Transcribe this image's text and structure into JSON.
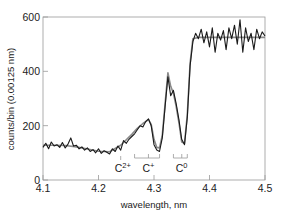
{
  "chart_data": {
    "type": "line",
    "title": "",
    "xlabel": "wavelength, nm",
    "ylabel": "counts/bin (0.00125 nm)",
    "xlim": [
      4.1,
      4.5
    ],
    "ylim": [
      0,
      600
    ],
    "xticks": [
      "4.1",
      "4.2",
      "4.3",
      "4.4",
      "4.5"
    ],
    "yticks": [
      "0",
      "200",
      "400",
      "600"
    ],
    "grid": false,
    "series": [
      {
        "name": "measured (noisy)",
        "color": "#1a1a1a",
        "x": [
          4.1,
          4.105,
          4.11,
          4.115,
          4.12,
          4.125,
          4.13,
          4.135,
          4.14,
          4.145,
          4.15,
          4.155,
          4.16,
          4.165,
          4.17,
          4.175,
          4.18,
          4.185,
          4.19,
          4.195,
          4.2,
          4.205,
          4.21,
          4.215,
          4.22,
          4.225,
          4.23,
          4.235,
          4.24,
          4.245,
          4.25,
          4.255,
          4.26,
          4.265,
          4.27,
          4.275,
          4.28,
          4.285,
          4.29,
          4.295,
          4.3,
          4.305,
          4.31,
          4.315,
          4.32,
          4.325,
          4.33,
          4.335,
          4.34,
          4.345,
          4.35,
          4.355,
          4.36,
          4.365,
          4.37,
          4.375,
          4.38,
          4.385,
          4.39,
          4.395,
          4.4,
          4.405,
          4.41,
          4.415,
          4.42,
          4.425,
          4.43,
          4.435,
          4.44,
          4.445,
          4.45,
          4.455,
          4.46,
          4.465,
          4.47,
          4.475,
          4.48,
          4.485,
          4.49,
          4.495,
          4.5
        ],
        "values": [
          120,
          135,
          115,
          140,
          125,
          130,
          120,
          138,
          118,
          132,
          155,
          125,
          128,
          115,
          122,
          110,
          118,
          105,
          112,
          100,
          115,
          98,
          108,
          102,
          96,
          115,
          105,
          125,
          110,
          145,
          135,
          150,
          160,
          170,
          185,
          200,
          195,
          215,
          225,
          200,
          130,
          110,
          105,
          155,
          270,
          380,
          310,
          330,
          280,
          220,
          150,
          130,
          230,
          420,
          510,
          540,
          520,
          555,
          505,
          545,
          490,
          560,
          470,
          540,
          515,
          550,
          480,
          560,
          520,
          570,
          500,
          590,
          470,
          560,
          510,
          540,
          480,
          555,
          520,
          545,
          530
        ]
      },
      {
        "name": "model fit (smooth)",
        "color": "#8a8a8a",
        "x": [
          4.1,
          4.12,
          4.14,
          4.16,
          4.18,
          4.2,
          4.22,
          4.24,
          4.26,
          4.27,
          4.28,
          4.29,
          4.295,
          4.3,
          4.305,
          4.31,
          4.315,
          4.32,
          4.325,
          4.33,
          4.335,
          4.34,
          4.345,
          4.35,
          4.355,
          4.36,
          4.365,
          4.37,
          4.38,
          4.4,
          4.45,
          4.5
        ],
        "values": [
          128,
          128,
          127,
          122,
          114,
          106,
          104,
          128,
          168,
          190,
          208,
          222,
          205,
          150,
          120,
          118,
          165,
          280,
          395,
          345,
          320,
          270,
          210,
          140,
          135,
          240,
          430,
          520,
          525,
          525,
          525,
          525
        ]
      }
    ],
    "annotations": [
      {
        "text": "C",
        "sup": "2+",
        "x": 4.24,
        "label": "C2+"
      },
      {
        "text": "C",
        "sup": "+",
        "x": 4.29,
        "label": "C+",
        "bracket": [
          4.265,
          4.31
        ]
      },
      {
        "text": "C",
        "sup": "0",
        "x": 4.35,
        "label": "C0",
        "bracket": [
          4.335,
          4.36
        ]
      }
    ]
  }
}
